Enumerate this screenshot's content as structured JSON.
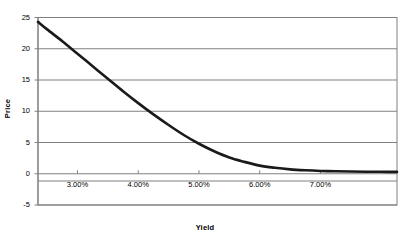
{
  "chart_data": {
    "type": "line",
    "title": "",
    "xlabel": "Yield",
    "ylabel": "Price",
    "xlim": [
      0.0235,
      0.0826
    ],
    "ylim": [
      -5,
      25
    ],
    "xtick_labels": [
      "3.00%",
      "4.00%",
      "5.00%",
      "6.00%",
      "7.00%"
    ],
    "xtick_values": [
      0.03,
      0.04,
      0.05,
      0.06,
      0.07
    ],
    "ytick_labels": [
      "25",
      "20",
      "15",
      "10",
      "5",
      "0",
      "-5"
    ],
    "ytick_values": [
      25,
      20,
      15,
      10,
      5,
      0,
      -5
    ],
    "grid": "horizontal",
    "legend": "none",
    "series": [
      {
        "name": "Price",
        "color": "#1a1a1a",
        "line_width": 2.6,
        "x": [
          0.0235,
          0.025,
          0.0275,
          0.03,
          0.0325,
          0.035,
          0.0375,
          0.04,
          0.0425,
          0.045,
          0.0475,
          0.05,
          0.0525,
          0.055,
          0.0575,
          0.06,
          0.0625,
          0.065,
          0.0675,
          0.07,
          0.0725,
          0.075,
          0.0775,
          0.08,
          0.0826
        ],
        "y": [
          24.3,
          23.1,
          21.2,
          19.2,
          17.2,
          15.2,
          13.2,
          11.3,
          9.5,
          7.8,
          6.2,
          4.8,
          3.6,
          2.6,
          1.9,
          1.3,
          0.95,
          0.7,
          0.55,
          0.45,
          0.4,
          0.36,
          0.33,
          0.31,
          0.3
        ]
      }
    ]
  },
  "plot": {
    "background": "#ffffff",
    "gridline_color": "#808080",
    "axis_color": "#808080",
    "border_color": "#808080"
  }
}
